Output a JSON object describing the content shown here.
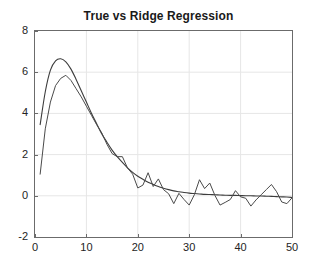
{
  "figure": {
    "background_color": "#ffffff",
    "axes_color": "#6b6b6b",
    "grid_color": "#e6e6e6",
    "tick_label_color": "#242424",
    "title_color": "#1a1a1a"
  },
  "chart_data": {
    "type": "line",
    "title": "True vs Ridge Regression",
    "xlabel": "",
    "ylabel": "",
    "xlim": [
      0,
      50
    ],
    "ylim": [
      -2,
      8
    ],
    "xticks": [
      0,
      10,
      20,
      30,
      40,
      50
    ],
    "yticks": [
      -2,
      0,
      2,
      4,
      6,
      8
    ],
    "xtick_labels": [
      "0",
      "10",
      "20",
      "30",
      "40",
      "50"
    ],
    "ytick_labels": [
      "-2",
      "0",
      "2",
      "4",
      "6",
      "8"
    ],
    "grid": true,
    "legend": null,
    "legend_position": "none",
    "series": [
      {
        "name": "True",
        "color": "#3c3c3c",
        "line_width": 1.1,
        "x": [
          1,
          2,
          3,
          4,
          5,
          6,
          7,
          8,
          9,
          10,
          11,
          12,
          13,
          14,
          15,
          16,
          17,
          18,
          19,
          20,
          21,
          22,
          23,
          24,
          25,
          26,
          27,
          28,
          29,
          30,
          31,
          32,
          33,
          34,
          35,
          36,
          37,
          38,
          39,
          40,
          41,
          42,
          43,
          44,
          45,
          46,
          47,
          48,
          49,
          50
        ],
        "values": [
          3.45,
          5.05,
          6.1,
          6.55,
          6.65,
          6.5,
          6.15,
          5.65,
          5.1,
          4.55,
          4.0,
          3.5,
          3.0,
          2.6,
          2.22,
          1.9,
          1.62,
          1.36,
          1.14,
          0.95,
          0.8,
          0.66,
          0.55,
          0.45,
          0.37,
          0.3,
          0.24,
          0.2,
          0.16,
          0.13,
          0.11,
          0.09,
          0.07,
          0.06,
          0.05,
          0.04,
          0.03,
          0.02,
          0.02,
          0.01,
          0.0,
          0.0,
          -0.01,
          -0.01,
          -0.02,
          -0.03,
          -0.04,
          -0.05,
          -0.06,
          -0.08
        ]
      },
      {
        "name": "Ridge Regression",
        "color": "#4a4a4a",
        "line_width": 1.0,
        "x": [
          1,
          2,
          3,
          4,
          5,
          6,
          7,
          8,
          9,
          10,
          11,
          12,
          13,
          14,
          15,
          16,
          17,
          18,
          19,
          20,
          21,
          22,
          23,
          24,
          25,
          26,
          27,
          28,
          29,
          30,
          31,
          32,
          33,
          34,
          35,
          36,
          37,
          38,
          39,
          40,
          41,
          42,
          43,
          44,
          45,
          46,
          47,
          48,
          49,
          50
        ],
        "values": [
          1.05,
          3.25,
          4.55,
          5.35,
          5.7,
          5.85,
          5.6,
          5.2,
          4.8,
          4.35,
          3.9,
          3.45,
          3.05,
          2.5,
          2.05,
          1.9,
          1.9,
          1.35,
          1.05,
          0.38,
          0.52,
          1.12,
          0.45,
          0.82,
          0.3,
          0.1,
          -0.38,
          0.12,
          -0.18,
          -0.45,
          0.05,
          0.78,
          0.35,
          0.62,
          0.02,
          -0.45,
          -0.32,
          -0.18,
          0.25,
          -0.05,
          -0.12,
          -0.5,
          -0.2,
          0.05,
          0.3,
          0.55,
          0.2,
          -0.3,
          -0.38,
          -0.1
        ]
      }
    ]
  }
}
